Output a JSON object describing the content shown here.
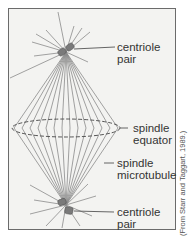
{
  "diagram": {
    "type": "mitotic spindle illustration",
    "labels": {
      "top_centriole": [
        "centriole",
        "pair"
      ],
      "equator": [
        "spindle",
        "equator"
      ],
      "microtubule": [
        "spindle",
        "microtubule"
      ],
      "bottom_centriole": [
        "centriole",
        "pair"
      ]
    },
    "citation": "(From Starr and Taggart, 1989.)",
    "colors": {
      "frame_border": "#6b6b6b",
      "frame_fill": "#f3f3f1",
      "fibers": "#8a8a8a",
      "centriole": "#7a7a7a",
      "text": "#333333"
    }
  }
}
